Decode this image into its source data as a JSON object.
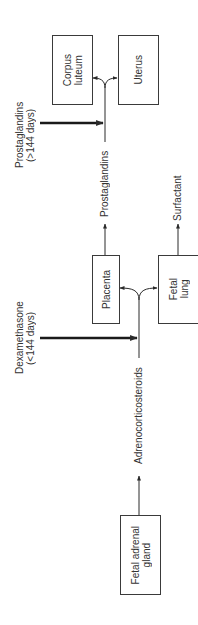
{
  "diagram": {
    "boxes": {
      "corpus_luteum": "Corpus\nluteum",
      "uterus": "Uterus",
      "placenta": "Placenta",
      "fetal_lung": "Fetal\nlung",
      "fetal_adrenal_gland": "Fetal adrenal\ngland"
    },
    "labels": {
      "prostaglandins_input_line1": "Prostaglandins",
      "prostaglandins_input_line2": "(>144 days)",
      "dexamethasone_line1": "Dexamethasone",
      "dexamethasone_line2": "(<144 days)",
      "prostaglandins_flow": "Prostaglandins",
      "surfactant": "Surfactant",
      "adrenocorticosteroids": "Adrenocorticosteroids"
    },
    "colors": {
      "line": "#2a2a2a",
      "box_border": "#3a3a3a",
      "background": "#ffffff"
    }
  }
}
